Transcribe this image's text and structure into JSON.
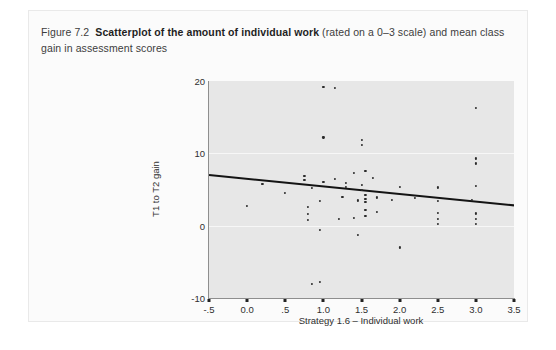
{
  "caption": {
    "figure_label": "Figure 7.2",
    "bold_text": "Scatterplot of the amount of individual work",
    "rest_text": "(rated on a 0–3 scale) and mean class gain in assessment scores"
  },
  "colors": {
    "panel_background": "#e7e7e7",
    "gridline": "#f7f7f7",
    "point": "#2b2b2b",
    "regression_line": "#141414",
    "axis": "#8e8e8e",
    "page_background": "#ffffff",
    "frame_background": "#fbfbfb"
  },
  "chart_data": {
    "type": "scatter",
    "title": "",
    "xlabel": "Strategy 1.6 – Individual work",
    "ylabel": "T1 to T2 gain",
    "xlim": [
      -0.5,
      3.5
    ],
    "ylim": [
      -10,
      20
    ],
    "xticks": [
      -0.5,
      0.0,
      0.5,
      1.0,
      1.5,
      2.0,
      2.5,
      3.0,
      3.5
    ],
    "xtick_labels": [
      "-.5",
      "0.0",
      ".5",
      "1.0",
      "1.5",
      "2.0",
      "2.5",
      "3.0",
      "3.5"
    ],
    "yticks": [
      -10,
      0,
      10,
      20
    ],
    "ytick_labels": [
      "-10",
      "0",
      "10",
      "20"
    ],
    "grid": "horizontal white gridlines at y = 0 and y = 10",
    "legend": "none",
    "series": [
      {
        "name": "Classes",
        "marker": "filled circle",
        "points": [
          [
            1.0,
            19.2
          ],
          [
            1.15,
            19.0
          ],
          [
            3.0,
            16.3
          ],
          [
            1.5,
            11.9
          ],
          [
            1.5,
            11.2
          ],
          [
            1.0,
            12.2
          ],
          [
            3.0,
            9.3
          ],
          [
            3.0,
            8.6
          ],
          [
            0.75,
            6.9
          ],
          [
            0.75,
            6.3
          ],
          [
            1.4,
            7.3
          ],
          [
            1.55,
            7.6
          ],
          [
            1.15,
            6.5
          ],
          [
            1.3,
            5.9
          ],
          [
            1.3,
            5.4
          ],
          [
            1.5,
            5.6
          ],
          [
            1.5,
            5.0
          ],
          [
            1.0,
            6.1
          ],
          [
            0.85,
            5.2
          ],
          [
            1.65,
            6.6
          ],
          [
            2.0,
            5.4
          ],
          [
            2.5,
            5.3
          ],
          [
            3.0,
            5.5
          ],
          [
            0.2,
            5.8
          ],
          [
            0.5,
            4.5
          ],
          [
            1.55,
            4.2
          ],
          [
            1.55,
            3.7
          ],
          [
            1.55,
            3.3
          ],
          [
            1.45,
            3.5
          ],
          [
            1.25,
            4.0
          ],
          [
            0.95,
            3.4
          ],
          [
            1.7,
            3.9
          ],
          [
            1.9,
            3.6
          ],
          [
            2.2,
            3.8
          ],
          [
            2.5,
            3.4
          ],
          [
            2.95,
            3.6
          ],
          [
            0.0,
            2.7
          ],
          [
            0.8,
            2.6
          ],
          [
            0.8,
            1.6
          ],
          [
            0.8,
            0.8
          ],
          [
            1.55,
            2.2
          ],
          [
            1.55,
            1.3
          ],
          [
            1.4,
            1.1
          ],
          [
            1.7,
            1.9
          ],
          [
            1.2,
            0.9
          ],
          [
            2.5,
            1.8
          ],
          [
            2.5,
            0.9
          ],
          [
            2.5,
            0.2
          ],
          [
            3.0,
            1.7
          ],
          [
            3.0,
            0.9
          ],
          [
            3.0,
            0.2
          ],
          [
            0.95,
            -0.6
          ],
          [
            1.45,
            -1.3
          ],
          [
            2.0,
            -3.0
          ],
          [
            0.85,
            -8.1
          ],
          [
            0.95,
            -7.8
          ]
        ]
      }
    ],
    "regression_line": {
      "x_start": -0.5,
      "y_start": 7.0,
      "x_end": 3.5,
      "y_end": 2.8,
      "slope": -1.05,
      "intercept": 6.475
    }
  }
}
